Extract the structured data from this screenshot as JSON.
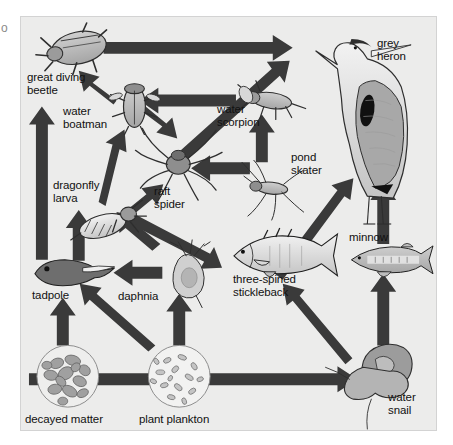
{
  "figure": {
    "background_color": "#ececeb",
    "frame_color": "#d3d3d3",
    "arrow_color": "#3a3a3a",
    "margin_glyph": "o"
  },
  "organisms": [
    {
      "id": "great-diving-beetle",
      "label": "great diving\nbeetle",
      "label_x": 6,
      "label_y": 54,
      "icon_x": 20,
      "icon_y": 8,
      "icon_w": 78,
      "icon_h": 48
    },
    {
      "id": "water-boatman",
      "label": "water\nboatman",
      "label_x": 42,
      "label_y": 88,
      "icon_x": 93,
      "icon_y": 68,
      "icon_w": 42,
      "icon_h": 48
    },
    {
      "id": "dragonfly-larva",
      "label": "dragonfly\nlarva",
      "label_x": 32,
      "label_y": 162,
      "icon_x": 57,
      "icon_y": 186,
      "icon_w": 62,
      "icon_h": 42
    },
    {
      "id": "raft-spider",
      "label": "raft\nspider",
      "label_x": 133,
      "label_y": 168,
      "icon_x": 115,
      "icon_y": 112,
      "icon_w": 88,
      "icon_h": 72
    },
    {
      "id": "water-scorpion",
      "label": "water\nscorpion",
      "label_x": 196,
      "label_y": 86,
      "icon_x": 222,
      "icon_y": 64,
      "icon_w": 56,
      "icon_h": 40
    },
    {
      "id": "pond-skater",
      "label": "pond\nskater",
      "label_x": 270,
      "label_y": 134,
      "icon_x": 220,
      "icon_y": 146,
      "icon_w": 70,
      "icon_h": 56
    },
    {
      "id": "grey-heron",
      "label": "grey\nheron",
      "label_x": 356,
      "label_y": 20,
      "icon_x": 290,
      "icon_y": 10,
      "icon_w": 100,
      "icon_h": 190
    },
    {
      "id": "tadpole",
      "label": "tadpole",
      "label_x": 11,
      "label_y": 272,
      "icon_x": 12,
      "icon_y": 244,
      "icon_w": 82,
      "icon_h": 30
    },
    {
      "id": "daphnia",
      "label": "daphnia",
      "label_x": 97,
      "label_y": 273,
      "icon_x": 148,
      "icon_y": 226,
      "icon_w": 40,
      "icon_h": 56
    },
    {
      "id": "three-spined-stickleback",
      "label": "three-spined\nstickleback",
      "label_x": 212,
      "label_y": 256,
      "icon_x": 210,
      "icon_y": 216,
      "icon_w": 110,
      "icon_h": 46
    },
    {
      "id": "minnow",
      "label": "minnow",
      "label_x": 328,
      "label_y": 214,
      "icon_x": 330,
      "icon_y": 228,
      "icon_w": 84,
      "icon_h": 30
    },
    {
      "id": "water-snail",
      "label": "water\nsnail",
      "label_x": 367,
      "label_y": 374,
      "icon_x": 334,
      "icon_y": 326,
      "icon_w": 72,
      "icon_h": 66
    },
    {
      "id": "decayed-matter",
      "label": "decayed matter",
      "label_x": 4,
      "label_y": 396,
      "icon_x": 16,
      "icon_y": 330,
      "icon_w": 62,
      "icon_h": 62
    },
    {
      "id": "plant-plankton",
      "label": "plant plankton",
      "label_x": 118,
      "label_y": 396,
      "icon_x": 128,
      "icon_y": 330,
      "icon_w": 62,
      "icon_h": 62
    }
  ],
  "feeding_links": [
    {
      "id": "link-beetle-to-heron",
      "from": "great-diving-beetle",
      "to": "grey-heron"
    },
    {
      "id": "link-boatman-to-beetle",
      "from": "water-boatman",
      "to": "great-diving-beetle"
    },
    {
      "id": "link-raftspider-to-heron",
      "from": "raft-spider",
      "to": "grey-heron"
    },
    {
      "id": "link-waterscorpion-to-boatman",
      "from": "water-scorpion",
      "to": "water-boatman"
    },
    {
      "id": "link-boatman-to-raftspider",
      "from": "water-boatman",
      "to": "raft-spider"
    },
    {
      "id": "link-pondskater-to-raftspider",
      "from": "pond-skater",
      "to": "raft-spider"
    },
    {
      "id": "link-pondskater-to-waterscorpion",
      "from": "pond-skater",
      "to": "water-scorpion"
    },
    {
      "id": "link-dragonfly-to-boatman",
      "from": "dragonfly-larva",
      "to": "water-boatman"
    },
    {
      "id": "link-dragonfly-to-raftspider",
      "from": "dragonfly-larva",
      "to": "raft-spider"
    },
    {
      "id": "link-dragonfly-to-stickleback",
      "from": "dragonfly-larva",
      "to": "three-spined-stickleback"
    },
    {
      "id": "link-tadpole-to-beetle",
      "from": "tadpole",
      "to": "great-diving-beetle"
    },
    {
      "id": "link-tadpole-to-dragonfly",
      "from": "tadpole",
      "to": "dragonfly-larva"
    },
    {
      "id": "link-daphnia-to-tadpole",
      "from": "daphnia",
      "to": "tadpole"
    },
    {
      "id": "link-daphnia-to-dragonfly",
      "from": "daphnia",
      "to": "dragonfly-larva"
    },
    {
      "id": "link-plankton-to-daphnia",
      "from": "plant-plankton",
      "to": "daphnia"
    },
    {
      "id": "link-plankton-to-tadpole",
      "from": "plant-plankton",
      "to": "tadpole"
    },
    {
      "id": "link-plankton-to-watersnail",
      "from": "plant-plankton",
      "to": "water-snail"
    },
    {
      "id": "link-decayed-to-tadpole",
      "from": "decayed-matter",
      "to": "tadpole"
    },
    {
      "id": "link-watersnail-to-stickleback",
      "from": "water-snail",
      "to": "three-spined-stickleback"
    },
    {
      "id": "link-watersnail-to-minnow",
      "from": "water-snail",
      "to": "minnow"
    },
    {
      "id": "link-stickleback-to-heron",
      "from": "three-spined-stickleback",
      "to": "grey-heron"
    },
    {
      "id": "link-minnow-to-heron",
      "from": "minnow",
      "to": "grey-heron"
    }
  ]
}
